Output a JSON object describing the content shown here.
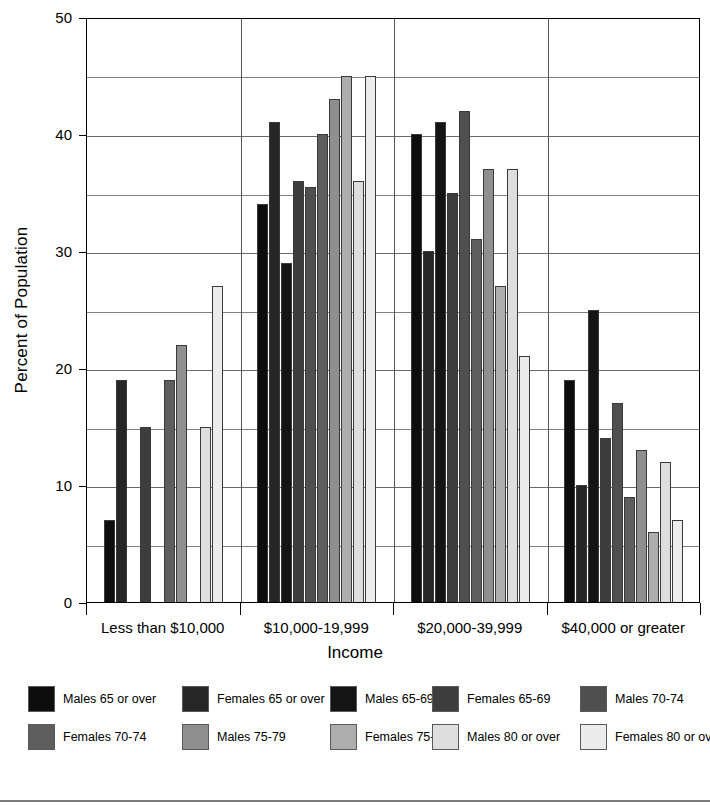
{
  "chart_data": {
    "type": "bar",
    "title": "",
    "xlabel": "Income",
    "ylabel": "Percent of Population",
    "ylim": [
      0,
      50
    ],
    "ytick_labels": [
      "0",
      "10",
      "20",
      "30",
      "40",
      "50"
    ],
    "ytick_values": [
      0,
      10,
      20,
      30,
      40,
      50
    ],
    "gridline_values": [
      5,
      10,
      15,
      20,
      25,
      30,
      35,
      40,
      45,
      50
    ],
    "grid": true,
    "legend_position": "bottom",
    "categories": [
      "Less than $10,000",
      "$10,000-19,999",
      "$20,000-39,999",
      "$40,000 or greater"
    ],
    "series": [
      {
        "name": "Males 65 or over",
        "color": "#0d0d0d",
        "values": [
          7,
          34,
          40,
          19
        ]
      },
      {
        "name": "Females 65 or over",
        "color": "#262626",
        "values": [
          19,
          41,
          30,
          10
        ]
      },
      {
        "name": "Males 65-69",
        "color": "#141414",
        "values": [
          0,
          29,
          41,
          25
        ]
      },
      {
        "name": "Females 65-69",
        "color": "#3d3d3d",
        "values": [
          15,
          36,
          35,
          14
        ]
      },
      {
        "name": "Males 70-74",
        "color": "#4f4f4f",
        "values": [
          0,
          35.5,
          42,
          17
        ]
      },
      {
        "name": "Females 70-74",
        "color": "#5e5e5e",
        "values": [
          19,
          40,
          31,
          9
        ]
      },
      {
        "name": "Males 75-79",
        "color": "#8f8f8f",
        "values": [
          22,
          43,
          37,
          13
        ]
      },
      {
        "name": "Females 75-79",
        "color": "#adadad",
        "values": [
          0,
          45,
          27,
          6
        ]
      },
      {
        "name": "Males 80 or over",
        "color": "#dedede",
        "values": [
          15,
          36,
          37,
          12
        ]
      },
      {
        "name": "Females 80 or over",
        "color": "#ececec",
        "values": [
          27,
          45,
          21,
          7
        ]
      }
    ]
  },
  "legend": {
    "rows": [
      [
        {
          "label": "Males 65 or over",
          "color": "#0d0d0d"
        },
        {
          "label": "Females 65 or over",
          "color": "#262626"
        },
        {
          "label": "Males 65-69",
          "color": "#141414"
        },
        {
          "label": "Females 65-69",
          "color": "#3d3d3d"
        },
        {
          "label": "Males 70-74",
          "color": "#4f4f4f"
        }
      ],
      [
        {
          "label": "Females 70-74",
          "color": "#5e5e5e"
        },
        {
          "label": "Males 75-79",
          "color": "#8f8f8f"
        },
        {
          "label": "Females 75-79",
          "color": "#adadad"
        },
        {
          "label": "Males 80 or over",
          "color": "#dedede"
        },
        {
          "label": "Females 80 or over",
          "color": "#ececec"
        }
      ]
    ]
  }
}
